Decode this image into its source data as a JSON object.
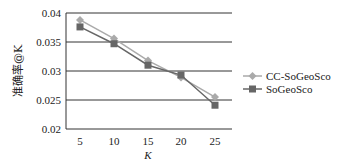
{
  "chart_data": {
    "type": "line",
    "title": "",
    "xlabel": "K",
    "ylabel": "准确率@K",
    "x": [
      5,
      10,
      15,
      20,
      25
    ],
    "categories": [
      "5",
      "10",
      "15",
      "20",
      "25"
    ],
    "ylim": [
      0.02,
      0.04
    ],
    "yticks": [
      "0.04",
      "0.035",
      "0.03",
      "0.025",
      "0.02"
    ],
    "grid": true,
    "legend_position": "right",
    "series": [
      {
        "name": "CC-SoGeoSco",
        "marker": "diamond",
        "color": "#aaaaaa",
        "values": [
          0.0388,
          0.0356,
          0.0318,
          0.0289,
          0.0255
        ]
      },
      {
        "name": "SoGeoSco",
        "marker": "square",
        "color": "#666666",
        "values": [
          0.0376,
          0.0347,
          0.031,
          0.0293,
          0.0241
        ]
      }
    ]
  }
}
